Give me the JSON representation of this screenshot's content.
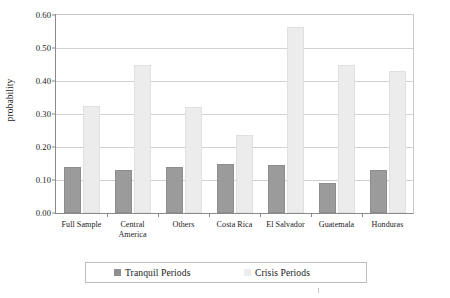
{
  "chart_data": {
    "type": "bar",
    "title": "",
    "subtitle": "",
    "xlabel": "",
    "ylabel": "probability",
    "ylim": [
      0.0,
      0.6
    ],
    "ytick_labels": [
      "0.00",
      "0.10",
      "0.20",
      "0.30",
      "0.40",
      "0.50",
      "0.60"
    ],
    "ytick_values": [
      0.0,
      0.1,
      0.2,
      0.3,
      0.4,
      0.5,
      0.6
    ],
    "grid": true,
    "grid_axis": "y",
    "legend_position": "bottom",
    "categories": [
      "Full Sample",
      "Central America",
      "Others",
      "Costa Rica",
      "El Salvador",
      "Guatemala",
      "Honduras"
    ],
    "series": [
      {
        "name": "Tranquil Periods",
        "color": "#9b9b9b",
        "values": [
          0.14,
          0.13,
          0.14,
          0.15,
          0.145,
          0.09,
          0.13
        ]
      },
      {
        "name": "Crisis Periods",
        "color": "#ececec",
        "values": [
          0.325,
          0.45,
          0.32,
          0.235,
          0.565,
          0.45,
          0.43
        ]
      }
    ]
  },
  "legend": {
    "entries": [
      {
        "label": "Tranquil Periods",
        "swatch_color": "#8f8f8f"
      },
      {
        "label": "Crisis Periods",
        "swatch_color": "#ededed"
      }
    ]
  },
  "axis": {
    "y_title": "probability"
  }
}
